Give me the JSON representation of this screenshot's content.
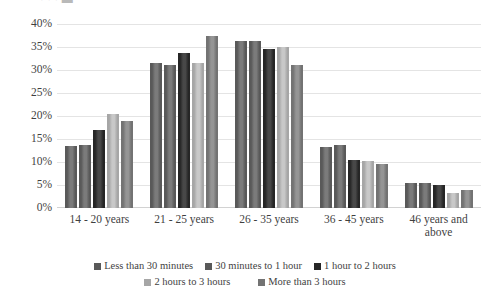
{
  "title_sliver": "·                 ·                                      ·        ▬",
  "chart_data": {
    "type": "bar",
    "title": "",
    "xlabel": "",
    "ylabel": "",
    "ylim": [
      0,
      40
    ],
    "ytick_values": [
      0,
      5,
      10,
      15,
      20,
      25,
      30,
      35,
      40
    ],
    "ytick_labels": [
      "0%",
      "5%",
      "10%",
      "15%",
      "20%",
      "25%",
      "30%",
      "35%",
      "40%"
    ],
    "grid": true,
    "legend_position": "bottom",
    "categories": [
      "14 - 20 years",
      "21 - 25 years",
      "26 - 35 years",
      "36 - 45 years",
      "46 years and above"
    ],
    "series": [
      {
        "name": "Less than 30 minutes",
        "color": "#595959",
        "values": [
          13.5,
          31.5,
          36.3,
          13.2,
          5.5
        ]
      },
      {
        "name": "30 minutes to 1 hour",
        "color": "#595959",
        "values": [
          13.8,
          31.0,
          36.3,
          13.8,
          5.5
        ]
      },
      {
        "name": "1 hour to 2 hours",
        "color": "#262626",
        "values": [
          17.0,
          33.7,
          34.5,
          10.5,
          5.0
        ]
      },
      {
        "name": "2 hours to 3 hours",
        "color": "#a6a6a6",
        "values": [
          20.5,
          31.5,
          35.0,
          10.3,
          3.2
        ]
      },
      {
        "name": "More than 3 hours",
        "color": "#737373",
        "values": [
          19.0,
          37.5,
          31.0,
          9.5,
          4.0
        ]
      }
    ]
  }
}
